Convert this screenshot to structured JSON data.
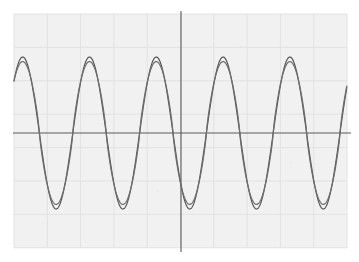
{
  "figure": {
    "name": "oscilloscope-waveform-display",
    "background_color": "#ffffff",
    "screen_color": "#f1f1f1",
    "width": 359,
    "height": 262
  },
  "grid": {
    "visible": true,
    "line_color": "#e2e2e2",
    "axis_color": "#5a5a5a",
    "left": 14,
    "top": 14,
    "right": 347,
    "bottom": 248,
    "columns": 10,
    "rows": 7,
    "cell_width": 33.3,
    "cell_height": 33.4,
    "x_axis_y": 133,
    "y_axis_x": 181
  },
  "chart_data": {
    "type": "line",
    "title": "",
    "subtitle": "",
    "xlabel": "",
    "ylabel": "",
    "xlim": [
      0,
      359
    ],
    "ylim": [
      -1.1,
      1.1
    ],
    "grid": true,
    "legend_position": "none",
    "tick_labels_x": [],
    "tick_labels_y": [],
    "annotations": [],
    "zero_line_y": 133,
    "peak_pixel_y": 57,
    "trough_pixel_y": 211,
    "cycles_visible": 5.5,
    "period_pixels": 66.8,
    "series": [
      {
        "name": "trace-1",
        "color": "#555555",
        "line_width": 1.2,
        "amplitude": 1.0,
        "period_px": 66.8,
        "phase_px": 8,
        "waveform": "sine",
        "shape_exponent": 1.0
      },
      {
        "name": "trace-2",
        "color": "#6e6e6e",
        "line_width": 1.2,
        "amplitude": 0.94,
        "period_px": 66.8,
        "phase_px": 8,
        "waveform": "sine-rounded",
        "shape_exponent": 1.22
      }
    ]
  }
}
